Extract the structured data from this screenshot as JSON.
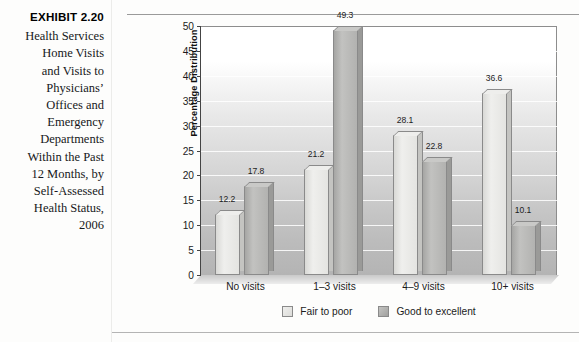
{
  "exhibit": {
    "number": "EXHIBIT 2.20",
    "caption": "Health Services\nHome Visits\nand Visits to\nPhysicians’\nOffices and\nEmergency\nDepartments\nWithin the Past\n12 Months, by\nSelf-Assessed\nHealth Status,\n2006"
  },
  "chart_data": {
    "type": "bar",
    "title": "",
    "xlabel": "",
    "ylabel": "Percentage Distribution",
    "ylim": [
      0,
      50
    ],
    "ytick_step": 5,
    "yticks": [
      "0",
      "5",
      "10",
      "15",
      "20",
      "25",
      "30",
      "35",
      "40",
      "45",
      "50"
    ],
    "grid": true,
    "legend_position": "bottom",
    "categories": [
      "No visits",
      "1–3 visits",
      "4–9 visits",
      "10+ visits"
    ],
    "series": [
      {
        "name": "Fair to poor",
        "color": "#e4e4e1",
        "values": [
          12.2,
          21.2,
          28.1,
          36.6
        ],
        "labels": [
          "12.2",
          "21.2",
          "28.1",
          "36.6"
        ]
      },
      {
        "name": "Good to excellent",
        "color": "#b2b2b0",
        "values": [
          17.8,
          49.3,
          22.8,
          10.1
        ],
        "labels": [
          "17.8",
          "49.3",
          "22.8",
          "10.1"
        ]
      }
    ]
  },
  "legend": {
    "items": [
      {
        "label": "Fair to poor",
        "swatch": "light"
      },
      {
        "label": "Good to excellent",
        "swatch": "dark"
      }
    ]
  }
}
